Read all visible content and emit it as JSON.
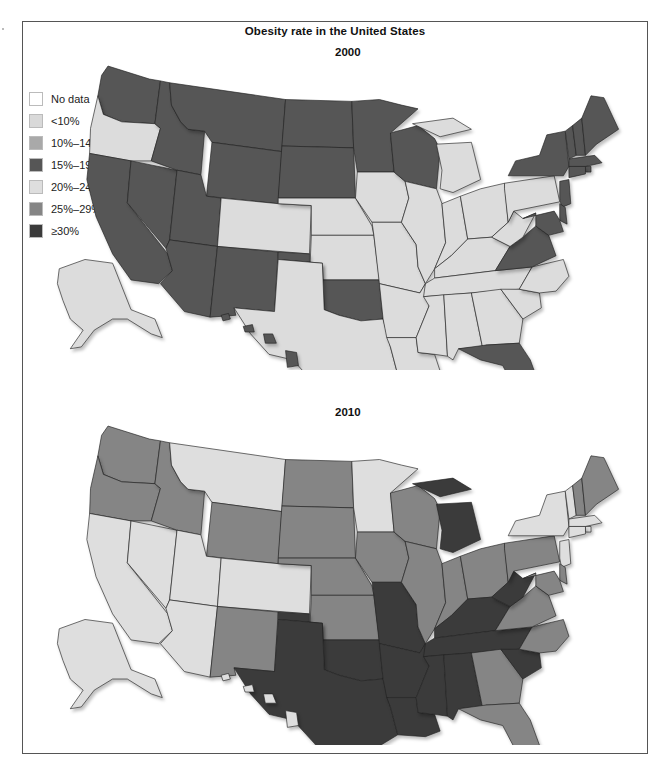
{
  "figure": {
    "title": "Obesity rate in the United States"
  },
  "legend": {
    "items": [
      {
        "label": "No data",
        "color": "#ffffff"
      },
      {
        "label": "<10%",
        "color": "#d9d9d9"
      },
      {
        "label": "10%–14%",
        "color": "#a9a9a9"
      },
      {
        "label": "15%–19%",
        "color": "#565656"
      },
      {
        "label": "20%–24%",
        "color": "#dedede"
      },
      {
        "label": "25%–29%",
        "color": "#858585"
      },
      {
        "label": "≥30%",
        "color": "#3b3b3b"
      }
    ]
  },
  "maps": [
    {
      "year": "2000",
      "fills": {
        "light": "#dcdcdc",
        "dark": "#565656"
      },
      "states": {
        "WA": "dark",
        "OR": "light",
        "CA": "dark",
        "NV": "dark",
        "ID": "dark",
        "MT": "dark",
        "WY": "dark",
        "UT": "dark",
        "AZ": "dark",
        "NM": "dark",
        "CO": "light",
        "ND": "dark",
        "SD": "dark",
        "NE": "light",
        "KS": "light",
        "OK": "dark",
        "TX": "light",
        "MN": "dark",
        "IA": "light",
        "MO": "light",
        "AR": "light",
        "LA": "light",
        "WI": "dark",
        "IL": "light",
        "MI": "light",
        "IN": "light",
        "OH": "light",
        "KY": "light",
        "TN": "light",
        "MS": "light",
        "AL": "light",
        "GA": "light",
        "FL": "dark",
        "SC": "light",
        "NC": "light",
        "VA": "dark",
        "WV": "light",
        "PA": "light",
        "NY": "dark",
        "VT": "dark",
        "NH": "dark",
        "ME": "dark",
        "MA": "dark",
        "RI": "dark",
        "CT": "dark",
        "NJ": "dark",
        "DE": "dark",
        "MD": "dark",
        "AK": "light",
        "HI": "dark"
      }
    },
    {
      "year": "2010",
      "fills": {
        "light": "#dedede",
        "mid": "#858585",
        "dark": "#3b3b3b"
      },
      "states": {
        "WA": "mid",
        "OR": "mid",
        "CA": "light",
        "NV": "light",
        "ID": "mid",
        "MT": "light",
        "WY": "mid",
        "UT": "light",
        "AZ": "light",
        "NM": "mid",
        "CO": "light",
        "ND": "mid",
        "SD": "mid",
        "NE": "mid",
        "KS": "mid",
        "OK": "dark",
        "TX": "dark",
        "MN": "light",
        "IA": "mid",
        "MO": "dark",
        "AR": "dark",
        "LA": "dark",
        "WI": "mid",
        "IL": "mid",
        "MI": "dark",
        "IN": "mid",
        "OH": "mid",
        "KY": "dark",
        "TN": "dark",
        "MS": "dark",
        "AL": "dark",
        "GA": "mid",
        "FL": "mid",
        "SC": "dark",
        "NC": "mid",
        "VA": "mid",
        "WV": "dark",
        "PA": "mid",
        "NY": "light",
        "VT": "light",
        "NH": "mid",
        "ME": "mid",
        "MA": "light",
        "RI": "light",
        "CT": "light",
        "NJ": "light",
        "DE": "mid",
        "MD": "mid",
        "AK": "light",
        "HI": "light"
      }
    }
  ],
  "chart_data": {
    "type": "choropleth",
    "title": "Obesity rate in the United States",
    "legend": [
      "No data",
      "<10%",
      "10%–14%",
      "15%–19%",
      "20%–24%",
      "25%–29%",
      "≥30%"
    ],
    "panels": [
      {
        "year": "2000",
        "categories": {
          "15%–19%": [
            "WA",
            "CA",
            "NV",
            "ID",
            "MT",
            "WY",
            "UT",
            "AZ",
            "NM",
            "ND",
            "SD",
            "OK",
            "MN",
            "WI",
            "FL",
            "VA",
            "NY",
            "VT",
            "NH",
            "ME",
            "MA",
            "RI",
            "CT",
            "NJ",
            "DE",
            "MD",
            "HI"
          ],
          "10%–14% (light shade)": [
            "OR",
            "CO",
            "NE",
            "KS",
            "TX",
            "IA",
            "MO",
            "AR",
            "LA",
            "IL",
            "MI",
            "IN",
            "OH",
            "KY",
            "TN",
            "MS",
            "AL",
            "GA",
            "SC",
            "NC",
            "WV",
            "PA",
            "AK"
          ]
        }
      },
      {
        "year": "2010",
        "categories": {
          "20%–24%": [
            "CA",
            "NV",
            "MT",
            "UT",
            "AZ",
            "CO",
            "MN",
            "NY",
            "VT",
            "MA",
            "RI",
            "CT",
            "NJ",
            "AK",
            "HI"
          ],
          "25%–29%": [
            "WA",
            "OR",
            "ID",
            "WY",
            "NM",
            "ND",
            "SD",
            "NE",
            "KS",
            "IA",
            "WI",
            "IL",
            "IN",
            "OH",
            "GA",
            "FL",
            "NC",
            "VA",
            "PA",
            "NH",
            "ME",
            "DE",
            "MD"
          ],
          "≥30%": [
            "OK",
            "TX",
            "MO",
            "AR",
            "LA",
            "MI",
            "KY",
            "TN",
            "MS",
            "AL",
            "SC",
            "WV"
          ]
        }
      }
    ]
  }
}
